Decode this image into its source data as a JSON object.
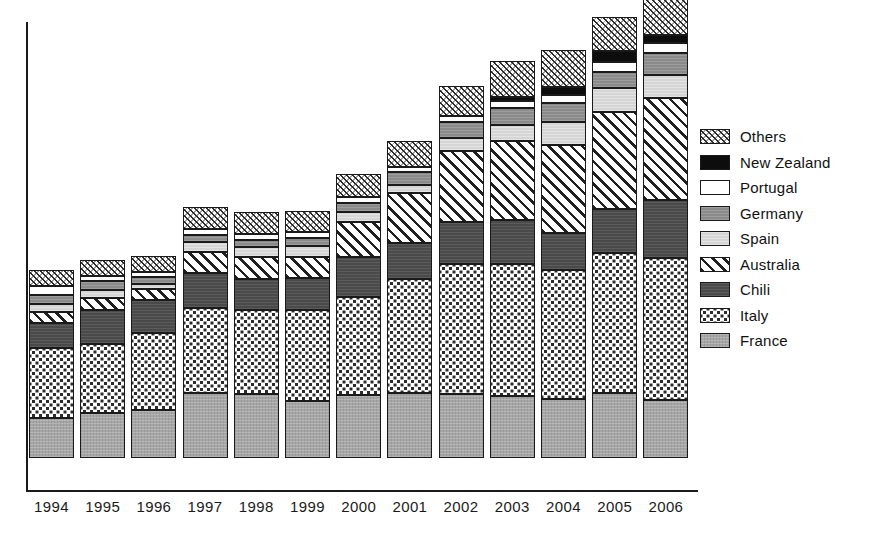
{
  "chart_data": {
    "type": "bar",
    "subtype": "stacked-bar",
    "title": "",
    "xlabel": "",
    "ylabel": "",
    "grid": false,
    "legend_position": "right",
    "axis": {
      "y_axis_visible": true,
      "x_axis_visible": true,
      "tick_labels_visible": false
    },
    "categories": [
      "1994",
      "1995",
      "1996",
      "1997",
      "1998",
      "1999",
      "2000",
      "2001",
      "2002",
      "2003",
      "2004",
      "2005",
      "2006"
    ],
    "series": [
      {
        "name": "France",
        "color": "#a6a6a6",
        "pattern": "solid-gray-texture",
        "values": [
          38,
          43,
          46,
          62,
          61,
          54,
          60,
          62,
          61,
          59,
          56,
          62,
          55
        ]
      },
      {
        "name": "Italy",
        "color": "#ffffff",
        "pattern": "white-dotted",
        "values": [
          67,
          66,
          73,
          81,
          80,
          87,
          94,
          109,
          124,
          126,
          123,
          134,
          136
        ]
      },
      {
        "name": "Chili",
        "color": "#4a4a4a",
        "pattern": "dark-gray",
        "values": [
          24,
          32,
          32,
          34,
          30,
          31,
          38,
          34,
          40,
          42,
          36,
          42,
          55
        ]
      },
      {
        "name": "Australia",
        "color": "#ffffff",
        "pattern": "diagonal-stripes",
        "values": [
          10,
          12,
          10,
          20,
          21,
          20,
          33,
          48,
          68,
          76,
          84,
          92,
          98
        ]
      },
      {
        "name": "Spain",
        "color": "#d5d5d5",
        "pattern": "light-gray",
        "values": [
          8,
          7,
          5,
          9,
          9,
          10,
          10,
          8,
          12,
          15,
          22,
          23,
          22
        ]
      },
      {
        "name": "Germany",
        "color": "#8a8a8a",
        "pattern": "medium-gray",
        "values": [
          9,
          9,
          7,
          7,
          7,
          8,
          8,
          12,
          16,
          16,
          18,
          15,
          21
        ]
      },
      {
        "name": "Portugal",
        "color": "#ffffff",
        "pattern": "white",
        "values": [
          8,
          5,
          5,
          6,
          6,
          6,
          6,
          5,
          5,
          7,
          7,
          10,
          9
        ]
      },
      {
        "name": "New Zealand",
        "color": "#0d0d0d",
        "pattern": "black",
        "values": [
          0,
          0,
          0,
          0,
          0,
          0,
          0,
          0,
          0,
          4,
          8,
          10,
          8
        ]
      },
      {
        "name": "Others",
        "color": "#ffffff",
        "pattern": "cross-hatch",
        "values": [
          15,
          15,
          15,
          21,
          21,
          20,
          22,
          25,
          29,
          34,
          35,
          33,
          35
        ]
      }
    ],
    "stack_order_bottom_to_top": [
      "France",
      "Italy",
      "Chili",
      "Australia",
      "Spain",
      "Germany",
      "Portugal",
      "New Zealand",
      "Others"
    ],
    "totals": [
      179,
      189,
      193,
      240,
      235,
      236,
      271,
      303,
      355,
      379,
      389,
      421,
      439
    ]
  },
  "legend": {
    "items": [
      {
        "label": "Others",
        "swatch": "others-swatch-icon"
      },
      {
        "label": "New Zealand",
        "swatch": "new-zealand-swatch-icon"
      },
      {
        "label": "Portugal",
        "swatch": "portugal-swatch-icon"
      },
      {
        "label": "Germany",
        "swatch": "germany-swatch-icon"
      },
      {
        "label": "Spain",
        "swatch": "spain-swatch-icon"
      },
      {
        "label": "Australia",
        "swatch": "australia-swatch-icon"
      },
      {
        "label": "Chili",
        "swatch": "chili-swatch-icon"
      },
      {
        "label": "Italy",
        "swatch": "italy-swatch-icon"
      },
      {
        "label": "France",
        "swatch": "france-swatch-icon"
      }
    ]
  },
  "colors": {
    "france": "#a6a6a6",
    "italy": "#ffffff",
    "chili": "#4a4a4a",
    "australia": "#ffffff",
    "spain": "#d5d5d5",
    "germany": "#8a8a8a",
    "portugal": "#ffffff",
    "new_zealand": "#0d0d0d",
    "others": "#ffffff",
    "axis": "#1a1a1a",
    "background": "#ffffff"
  }
}
